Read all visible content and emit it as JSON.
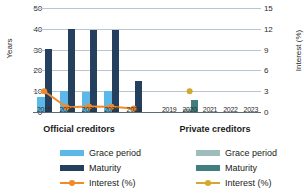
{
  "chart_data": {
    "type": "bar",
    "title": "",
    "xlabel": "",
    "ylabel": "Years",
    "y2label": "Interest (%)",
    "ylim": [
      0,
      50
    ],
    "y2lim": [
      0,
      15
    ],
    "yticks": [
      0,
      10,
      20,
      30,
      40,
      50
    ],
    "y2ticks": [
      0,
      3,
      6,
      9,
      12,
      15
    ],
    "grid": true,
    "legend_position": "bottom",
    "categories": [
      "2019",
      "2020",
      "2021",
      "2022",
      "2023"
    ],
    "panels": [
      {
        "name": "Official creditors",
        "series": [
          {
            "name": "Grace period",
            "type": "bar",
            "axis": "left",
            "color": "#5BB8E8",
            "values": [
              7,
              10,
              9.7,
              10,
              0
            ]
          },
          {
            "name": "Maturity",
            "type": "bar",
            "axis": "left",
            "color": "#24405E",
            "values": [
              30.5,
              39.7,
              39.5,
              39.6,
              15
            ]
          },
          {
            "name": "Interest (%)",
            "type": "line",
            "axis": "right",
            "color": "#F08A2B",
            "values": [
              3.0,
              0.7,
              0.8,
              0.75,
              0.5
            ]
          }
        ]
      },
      {
        "name": "Private creditors",
        "series": [
          {
            "name": "Grace period",
            "type": "bar",
            "axis": "left",
            "color": "#9EBCBC",
            "values": [
              0,
              1.5,
              0,
              0,
              0
            ]
          },
          {
            "name": "Maturity",
            "type": "bar",
            "axis": "left",
            "color": "#417F7F",
            "values": [
              0,
              6,
              0,
              0,
              0
            ]
          },
          {
            "name": "Interest (%)",
            "type": "line",
            "axis": "right",
            "color": "#D2A82E",
            "values": [
              null,
              3.0,
              null,
              null,
              null
            ]
          }
        ]
      }
    ]
  },
  "axes": {
    "left_label": "Years",
    "right_label": "Interest (%)",
    "left_ticks": [
      "0",
      "10",
      "20",
      "30",
      "40",
      "50"
    ],
    "right_ticks": [
      "0",
      "3",
      "6",
      "9",
      "12",
      "15"
    ],
    "x_ticks": [
      "2019",
      "2020",
      "2021",
      "2022",
      "2023"
    ]
  },
  "captions": {
    "official": "Official creditors",
    "private": "Private creditors"
  },
  "legend": {
    "official": [
      {
        "label": "Grace period",
        "color": "#5BB8E8",
        "kind": "bar"
      },
      {
        "label": "Maturity",
        "color": "#24405E",
        "kind": "bar"
      },
      {
        "label": "Interest (%)",
        "color": "#F08A2B",
        "kind": "line"
      }
    ],
    "private": [
      {
        "label": "Grace period",
        "color": "#9EBCBC",
        "kind": "bar"
      },
      {
        "label": "Maturity",
        "color": "#417F7F",
        "kind": "bar"
      },
      {
        "label": "Interest (%)",
        "color": "#D2A82E",
        "kind": "line"
      }
    ]
  }
}
